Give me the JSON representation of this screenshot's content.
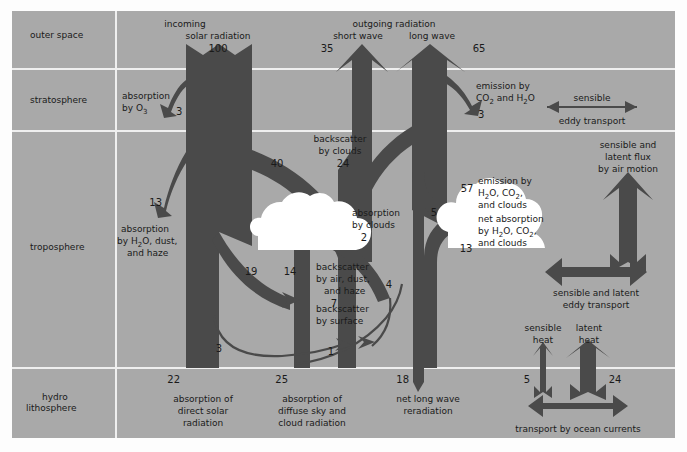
{
  "figure": {
    "background_color": "#a9a9a9",
    "flow_color": "#4a4a4a",
    "cloud_color": "#ffffff",
    "grid_color": "#f0f0f0",
    "text_color": "#1a1a1a"
  },
  "zones": [
    {
      "id": "outer-space",
      "label": "outer space"
    },
    {
      "id": "stratosphere",
      "label": "stratosphere"
    },
    {
      "id": "troposphere",
      "label": "troposphere"
    },
    {
      "id": "hydro-lithosphere",
      "label_line1": "hydro",
      "label_line2": "lithosphere"
    }
  ],
  "flows": {
    "incoming_solar": {
      "label_line1": "incoming",
      "label_line2": "solar radiation",
      "value": "100"
    },
    "outgoing_radiation": {
      "heading": "outgoing radiation",
      "short_wave_label": "short wave",
      "short_wave_value": "35",
      "long_wave_label": "long wave",
      "long_wave_value": "65"
    },
    "absorption_o3": {
      "label_line1": "absorption",
      "label_line2": "by O",
      "sub": "3",
      "value": "3"
    },
    "emission_co2_h2o": {
      "label_line1": "emission by",
      "label_line2": "CO",
      "sub1": "2",
      "label_line2b": " and H",
      "sub2": "2",
      "label_line2c": "O",
      "value": "3"
    },
    "sensible_eddy_transport_strato": {
      "label_line1": "sensible",
      "label_line2": "eddy transport"
    },
    "backscatter_by_clouds": {
      "label_line1": "backscatter",
      "label_line2": "by clouds",
      "value_left": "40",
      "value_right": "24"
    },
    "absorption_h2o_dust_haze": {
      "label_line1": "absorption",
      "label_line2": "by H",
      "sub": "2",
      "label_line2b": "O, dust,",
      "label_line3": "and haze",
      "value": "13"
    },
    "absorption_by_clouds": {
      "label_line1": "absorption",
      "label_line2": "by clouds",
      "value": "2"
    },
    "backscatter_air_dust_haze": {
      "label_line1": "backscatter",
      "label_line2": "by air, dust,",
      "label_line3": "and haze",
      "value": "7",
      "value_left": "19",
      "value_mid": "14",
      "value_right": "4"
    },
    "backscatter_by_surface": {
      "label_line1": "backscatter",
      "label_line2": "by surface",
      "value": "1"
    },
    "diffuse_to_surface": {
      "value": "3"
    },
    "emission_h2o_co2_clouds": {
      "label_line1": "emission by",
      "label_line2": "H",
      "sub1": "2",
      "label_line2b": "O, CO",
      "sub2": "2",
      "label_line2c": ",",
      "label_line3": "and clouds",
      "value": "57"
    },
    "net_absorption_h2o_co2_clouds": {
      "label_line1": "net absorption",
      "label_line2": "by H",
      "sub1": "2",
      "label_line2b": "O, CO",
      "sub2": "2",
      "label_line2c": ",",
      "label_line3": "and clouds",
      "value_left": "5",
      "value_bottom": "13"
    },
    "sensible_latent_flux_air_motion": {
      "label_line1": "sensible and",
      "label_line2": "latent flux",
      "label_line3": "by air motion"
    },
    "sensible_latent_eddy_transport": {
      "label_line1": "sensible and latent",
      "label_line2": "eddy transport"
    },
    "absorption_direct_solar": {
      "label_line1": "absorption of",
      "label_line2": "direct solar",
      "label_line3": "radiation",
      "value": "22"
    },
    "absorption_diffuse_sky": {
      "label_line1": "absorption of",
      "label_line2": "diffuse sky and",
      "label_line3": "cloud radiation",
      "value": "25"
    },
    "net_long_wave_reradiation": {
      "label_line1": "net long wave",
      "label_line2": "reradiation",
      "value": "18"
    },
    "sensible_heat": {
      "label_line1": "sensible",
      "label_line2": "heat",
      "value": "5"
    },
    "latent_heat": {
      "label_line1": "latent",
      "label_line2": "heat",
      "value": "24"
    },
    "transport_ocean_currents": {
      "label": "transport by ocean currents"
    }
  }
}
